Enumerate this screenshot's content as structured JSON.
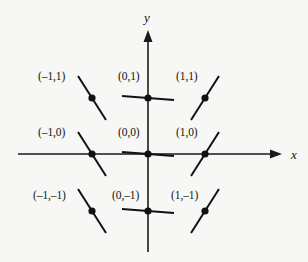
{
  "figure": {
    "background_color": "#f7f7f5",
    "ink_color": "#111111",
    "width": 308,
    "height": 262
  },
  "axes": {
    "x_label": "x",
    "y_label": "y",
    "x_label_pos": {
      "x": 291,
      "y": 148
    },
    "y_label_pos": {
      "x": 144,
      "y": 11
    },
    "origin_px": {
      "x": 148,
      "y": 154
    },
    "x_axis_px": {
      "x1": 18,
      "y1": 154,
      "x2": 282,
      "y2": 154
    },
    "y_axis_px": {
      "x1": 148,
      "y1": 30,
      "x2": 148,
      "y2": 252
    },
    "x_arrow": "right",
    "y_arrow": "up",
    "grid": false,
    "tick_labels": []
  },
  "chart_data": {
    "type": "scatter",
    "title": "",
    "xlabel": "x",
    "ylabel": "y",
    "xlim": [
      -2.3,
      2.3
    ],
    "ylim": [
      -2.2,
      2.2
    ],
    "grid": false,
    "legend": "none",
    "points": [
      {
        "label": "(–1,1)",
        "x": -1,
        "y": 1,
        "slope": "negative",
        "px": {
          "x": 92,
          "y": 98
        },
        "label_px": {
          "x": 38,
          "y": 71
        },
        "seg_dx": 14,
        "seg_dy": 22
      },
      {
        "label": "(0,1)",
        "x": 0,
        "y": 1,
        "slope": "zero",
        "px": {
          "x": 148,
          "y": 98
        },
        "label_px": {
          "x": 118,
          "y": 71
        },
        "seg_dx": 26,
        "seg_dy": 2
      },
      {
        "label": "(1,1)",
        "x": 1,
        "y": 1,
        "slope": "positive",
        "px": {
          "x": 205,
          "y": 98
        },
        "label_px": {
          "x": 176,
          "y": 71
        },
        "seg_dx": 14,
        "seg_dy": -22
      },
      {
        "label": "(–1,0)",
        "x": -1,
        "y": 0,
        "slope": "negative",
        "px": {
          "x": 92,
          "y": 154
        },
        "label_px": {
          "x": 38,
          "y": 127
        },
        "seg_dx": 14,
        "seg_dy": 22
      },
      {
        "label": "(0,0)",
        "x": 0,
        "y": 0,
        "slope": "zero",
        "px": {
          "x": 148,
          "y": 154
        },
        "label_px": {
          "x": 118,
          "y": 127
        },
        "seg_dx": 26,
        "seg_dy": 2
      },
      {
        "label": "(1,0)",
        "x": 1,
        "y": 0,
        "slope": "positive",
        "px": {
          "x": 205,
          "y": 154
        },
        "label_px": {
          "x": 176,
          "y": 127
        },
        "seg_dx": 14,
        "seg_dy": -22
      },
      {
        "label": "(–1,–1)",
        "x": -1,
        "y": -1,
        "slope": "negative",
        "px": {
          "x": 92,
          "y": 211
        },
        "label_px": {
          "x": 33,
          "y": 190
        },
        "seg_dx": 14,
        "seg_dy": 22
      },
      {
        "label": "(0,–1)",
        "x": 0,
        "y": -1,
        "slope": "zero",
        "px": {
          "x": 148,
          "y": 211
        },
        "label_px": {
          "x": 112,
          "y": 190
        },
        "seg_dx": 26,
        "seg_dy": 2
      },
      {
        "label": "(1,–1)",
        "x": 1,
        "y": -1,
        "slope": "positive",
        "px": {
          "x": 205,
          "y": 211
        },
        "label_px": {
          "x": 171,
          "y": 190
        },
        "seg_dx": 14,
        "seg_dy": -22
      }
    ]
  }
}
